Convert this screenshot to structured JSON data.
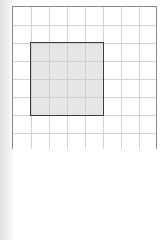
{
  "grid": {
    "columns": 8,
    "rows": 8,
    "cell_size_px": 18,
    "line_color": "#d4d4d4",
    "border_color": "#8a8a8a"
  },
  "shaded_square": {
    "col_start": 1,
    "row_start": 2,
    "width_cells": 4,
    "height_cells": 4,
    "fill": "#dcdcdc",
    "border": "#3c3c3c"
  }
}
